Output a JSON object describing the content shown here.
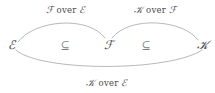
{
  "diagram": {
    "background_color": "#ffffff",
    "stroke_color": "#9a9a9a",
    "text_color": "#4a4a4a",
    "nodes": [
      {
        "id": "E",
        "label": "ℰ",
        "x": 11,
        "y": 45
      },
      {
        "id": "F",
        "label": "ℱ",
        "x": 108,
        "y": 45
      },
      {
        "id": "K",
        "label": "𝒦",
        "x": 202,
        "y": 45
      }
    ],
    "relations": [
      {
        "id": "E-subset-F",
        "symbol": "⊆",
        "x": 65,
        "y": 45
      },
      {
        "id": "F-subset-K",
        "symbol": "⊆",
        "x": 146,
        "y": 45
      }
    ],
    "edges": [
      {
        "id": "F-over-E",
        "from": "E",
        "to": "F",
        "position": "top-left",
        "label_script_1": "ℱ",
        "label_plain": "over",
        "label_script_2": "ℰ",
        "label_full": "ℱ over ℰ",
        "label_x": 66,
        "label_y": 10,
        "path": "M 18 42 C 34 20, 88 15, 105 38"
      },
      {
        "id": "K-over-F",
        "from": "F",
        "to": "K",
        "position": "top-right",
        "label_script_1": "𝒦",
        "label_plain": "over",
        "label_script_2": "ℱ",
        "label_full": "𝒦 over ℱ",
        "label_x": 155,
        "label_y": 10,
        "path": "M 112 38 C 130 15, 184 20, 198 40"
      },
      {
        "id": "K-over-E",
        "from": "E",
        "to": "K",
        "position": "bottom",
        "label_script_1": "𝒦",
        "label_plain": "over",
        "label_script_2": "ℰ",
        "label_full": "𝒦 over ℰ",
        "label_x": 107,
        "label_y": 83,
        "path": "M 16 50 C 40 72, 170 72, 202 50"
      }
    ]
  }
}
